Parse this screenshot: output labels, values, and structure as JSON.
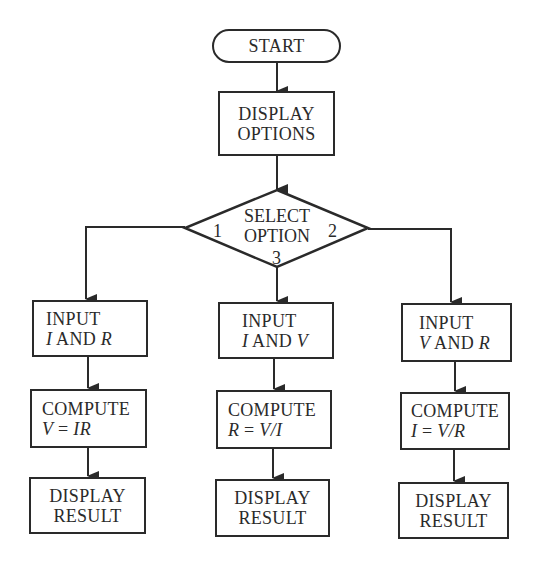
{
  "flowchart": {
    "start": {
      "label": "START"
    },
    "display_options": {
      "line1": "DISPLAY",
      "line2": "OPTIONS"
    },
    "decision": {
      "line1": "SELECT",
      "line2": "OPTION",
      "branch_labels": {
        "left": "1",
        "right": "2",
        "bottom": "3"
      }
    },
    "branches": [
      {
        "id": "option-1",
        "input": {
          "line1": "INPUT",
          "var_a": "I",
          "conj": " AND ",
          "var_b": "R"
        },
        "compute": {
          "line1": "COMPUTE",
          "lhs": "V",
          "eq": " = ",
          "rhs": "IR"
        },
        "display": {
          "line1": "DISPLAY",
          "line2": "RESULT"
        }
      },
      {
        "id": "option-3",
        "input": {
          "line1": "INPUT",
          "var_a": "I",
          "conj": " AND ",
          "var_b": "V"
        },
        "compute": {
          "line1": "COMPUTE",
          "lhs": "R",
          "eq": " = ",
          "rhs": "V/I"
        },
        "display": {
          "line1": "DISPLAY",
          "line2": "RESULT"
        }
      },
      {
        "id": "option-2",
        "input": {
          "line1": "INPUT",
          "var_a": "V",
          "conj": " AND ",
          "var_b": "R"
        },
        "compute": {
          "line1": "COMPUTE",
          "lhs": "I",
          "eq": " = ",
          "rhs": "V/R"
        },
        "display": {
          "line1": "DISPLAY",
          "line2": "RESULT"
        }
      }
    ],
    "colors": {
      "stroke": "#2a2a2a",
      "background": "#ffffff"
    }
  }
}
